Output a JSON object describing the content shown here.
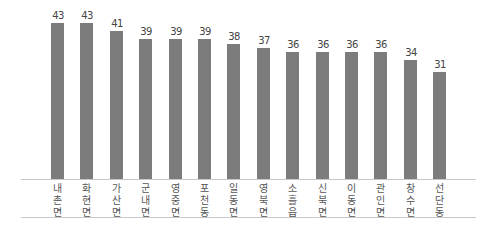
{
  "chart_data": {
    "type": "bar",
    "title": "",
    "xlabel": "",
    "ylabel": "",
    "categories": [
      "내촌면",
      "화현면",
      "가산면",
      "군내면",
      "영중면",
      "포천동",
      "일동면",
      "영북면",
      "소흘읍",
      "신북면",
      "이동면",
      "관인면",
      "창수면",
      "선단동"
    ],
    "values": [
      43,
      43,
      41,
      39,
      39,
      39,
      38,
      37,
      36,
      36,
      36,
      36,
      34,
      31
    ],
    "bar_color": "#7c7c7c",
    "grid": false,
    "legend": null,
    "data_labels": true
  }
}
